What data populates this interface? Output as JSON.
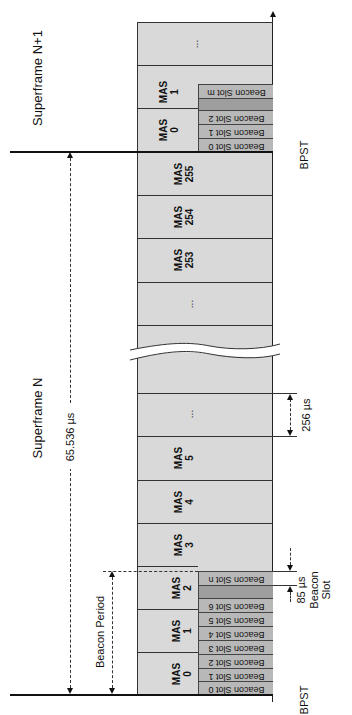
{
  "labels": {
    "superframe_next": "Superframe N+1",
    "superframe_current": "Superframe N",
    "superframe_duration": "65.536 µs",
    "beacon_period": "Beacon Period",
    "bpst_bottom": "BPST",
    "bpst_top": "BPST",
    "mas_duration": "256 µs",
    "beacon_slot_duration": "85 µs",
    "beacon_slot_caption_1": "Beacon",
    "beacon_slot_caption_2": "Slot",
    "ellipsis": "..."
  },
  "superframe_n_plus_1": {
    "mas": [
      {
        "label": "MAS",
        "num": "0"
      },
      {
        "label": "MAS",
        "num": "1"
      }
    ],
    "beacon_slots": [
      "Beacon Slot 0",
      "Beacon Slot 1",
      "Beacon Slot 2",
      "",
      "Beacon Slot m"
    ]
  },
  "superframe_n": {
    "mas_top": [
      {
        "label": "MAS",
        "num": "253"
      },
      {
        "label": "MAS",
        "num": "254"
      },
      {
        "label": "MAS",
        "num": "255"
      }
    ],
    "mas_bottom": [
      {
        "label": "MAS",
        "num": "0"
      },
      {
        "label": "MAS",
        "num": "1"
      },
      {
        "label": "MAS",
        "num": "2"
      },
      {
        "label": "MAS",
        "num": "3"
      },
      {
        "label": "MAS",
        "num": "4"
      },
      {
        "label": "MAS",
        "num": "5"
      }
    ],
    "beacon_slots": [
      "Beacon Slot 0",
      "Beacon Slot 1",
      "Beacon Slot 2",
      "Beacon Slot 3",
      "Beacon Slot 4",
      "Beacon Slot 5",
      "Beacon Slot 6",
      "",
      "Beacon Slot n"
    ]
  },
  "colors": {
    "mas_fill": "#d9d9d9",
    "beacon_slot_fill": "#b8b8b8",
    "beacon_gap_fill": "#9e9e9e",
    "line": "#333333"
  }
}
